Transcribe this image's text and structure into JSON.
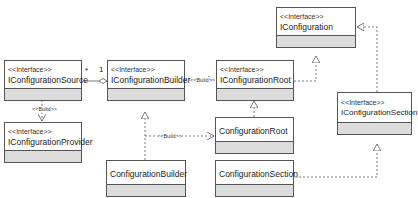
{
  "classes": {
    "iconfiguration_source": {
      "stereotype": "<<Interface>>",
      "name": "IConfigurationSource"
    },
    "iconfiguration_provider": {
      "stereotype": "<<Interface>>",
      "name": "IConfigurationProvider"
    },
    "iconfiguration_builder": {
      "stereotype": "<<Interface>>",
      "name": "IConfigurationBuilder"
    },
    "iconfiguration_root": {
      "stereotype": "<<Interface>>",
      "name": "IConfigurationRoot"
    },
    "iconfiguration": {
      "stereotype": "<<Interface>>",
      "name": "IConfiguration"
    },
    "iconfiguration_section": {
      "stereotype": "<<Interface>>",
      "name": "IConfigurationSection"
    },
    "configuration_root": {
      "name": "ConfigurationRoot"
    },
    "configuration_builder": {
      "name": "ConfigurationBuilder"
    },
    "configuration_section": {
      "name": "ConfigurationSection"
    }
  },
  "relations": {
    "source_builder": {
      "mult_source": "*",
      "mult_builder": "1"
    },
    "source_provider_label": "<<Build>>",
    "builder_root_label": "<<Build>>",
    "cbuilder_croot_label": "<<Build>>"
  },
  "colors": {
    "border": "#555555",
    "compartment": "#dcdcdc",
    "line": "#555555"
  }
}
